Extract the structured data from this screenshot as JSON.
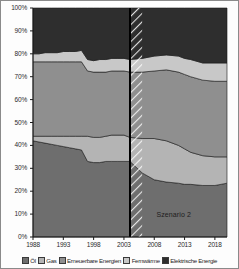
{
  "chart_data": {
    "type": "area",
    "stacked": true,
    "normalized_percent": true,
    "title": "",
    "subtitle": "",
    "xlabel": "",
    "ylabel": "",
    "xlim": [
      1988,
      2020
    ],
    "ylim": [
      0,
      100
    ],
    "grid": false,
    "legend_position": "bottom",
    "annotations": [
      {
        "text": "Szenario 2",
        "x": 2012,
        "y": 9
      }
    ],
    "forecast_divider_year": 2004,
    "forecast_hatch_band": [
      2004,
      2006
    ],
    "x": [
      1988,
      1989,
      1990,
      1991,
      1992,
      1993,
      1994,
      1995,
      1996,
      1997,
      1998,
      1999,
      2000,
      2001,
      2002,
      2003,
      2004,
      2006,
      2008,
      2010,
      2012,
      2013,
      2014,
      2016,
      2018,
      2020
    ],
    "xticks": [
      "1988",
      "1993",
      "1998",
      "2003",
      "2008",
      "2013",
      "2018"
    ],
    "xtick_values": [
      1988,
      1993,
      1998,
      2003,
      2008,
      2013,
      2018
    ],
    "yticks": [
      "0%",
      "10%",
      "20%",
      "30%",
      "40%",
      "50%",
      "60%",
      "70%",
      "80%",
      "90%",
      "100%"
    ],
    "ytick_values": [
      0,
      10,
      20,
      30,
      40,
      50,
      60,
      70,
      80,
      90,
      100
    ],
    "series": [
      {
        "name": "Öl",
        "color": "#6e6e6e",
        "values": [
          42,
          41.5,
          41,
          40.5,
          40,
          39.5,
          39,
          38.5,
          38,
          33,
          32.5,
          32.5,
          33,
          33,
          33,
          33,
          33,
          28,
          25,
          24,
          23.5,
          23,
          23,
          22.5,
          22.5,
          23.5
        ]
      },
      {
        "name": "Gas",
        "color": "#b4b4b4",
        "values": [
          2,
          2.5,
          3,
          3.5,
          4,
          4.5,
          5,
          5.5,
          6,
          11,
          11,
          11,
          11,
          11.5,
          11.5,
          11.5,
          10.5,
          15,
          18,
          18,
          16.5,
          15.5,
          14,
          13,
          12.5,
          11.5
        ]
      },
      {
        "name": "Erneuerbare Energien",
        "color": "#8f8f8f",
        "values": [
          32.5,
          32.5,
          32.5,
          32.5,
          32.5,
          32.5,
          32.5,
          32.5,
          32.5,
          28.5,
          28.5,
          28.5,
          28,
          28,
          28,
          28,
          28.5,
          29,
          29.5,
          31,
          32,
          32.5,
          33,
          33,
          33,
          33
        ]
      },
      {
        "name": "Fernwärme",
        "color": "#c8c8c8",
        "values": [
          3.5,
          3.5,
          4,
          4,
          4,
          4.5,
          4.5,
          4.5,
          5,
          5,
          5,
          5.5,
          5.5,
          5.5,
          5.5,
          5.5,
          5.5,
          6,
          6.5,
          6.5,
          7,
          7,
          7.5,
          7.5,
          8,
          8
        ]
      },
      {
        "name": "Elektrische Energie",
        "color": "#2e2e2e",
        "values": [
          20,
          20,
          19.5,
          19.5,
          19.5,
          19,
          19,
          19,
          18.5,
          22.5,
          23,
          22.5,
          22.5,
          22,
          22,
          22,
          22.5,
          22,
          21,
          20.5,
          21,
          22,
          22.5,
          24,
          24,
          24
        ]
      }
    ]
  },
  "legend": {
    "items": [
      {
        "label": "Öl"
      },
      {
        "label": "Gas"
      },
      {
        "label": "Erneuerbare Energien"
      },
      {
        "label": "Fernwärme"
      },
      {
        "label": "Elektrische Energie"
      }
    ]
  }
}
